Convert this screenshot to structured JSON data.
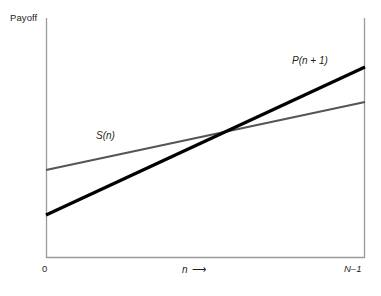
{
  "chart_data": {
    "type": "line",
    "title": "",
    "subtitle": "",
    "xlabel": "n",
    "xlabel_arrow": "⟶",
    "ylabel": "Payoff",
    "xticks": [
      "0",
      "N–1"
    ],
    "yticks": [],
    "grid": false,
    "legend": "inline-annotations",
    "xlim": [
      0,
      1
    ],
    "ylim": [
      0,
      1
    ],
    "axis_color": "#9a9a9a",
    "series": [
      {
        "name": "S(n)",
        "label": "S(n)",
        "color": "#555555",
        "width": 2.2,
        "x": [
          0,
          1
        ],
        "y": [
          0.367,
          0.65
        ],
        "px": [
          [
            46,
            170
          ],
          [
            365,
            102
          ]
        ],
        "label_pos": [
          96,
          131
        ]
      },
      {
        "name": "P(n + 1)",
        "label": "P(n + 1)",
        "color": "#000000",
        "width": 3.2,
        "x": [
          0,
          1
        ],
        "y": [
          0.179,
          0.796
        ],
        "px": [
          [
            46,
            215
          ],
          [
            365,
            67
          ]
        ],
        "label_pos": [
          292,
          56
        ]
      }
    ],
    "intersection": {
      "px": [
        218,
        132
      ]
    },
    "annotations": [
      {
        "text": "S(n)",
        "x": 96,
        "y": 131
      },
      {
        "text": "P(n + 1)",
        "x": 292,
        "y": 56
      }
    ]
  },
  "axes": {
    "y_axis_label": "Payoff",
    "x_axis_label": "n",
    "x_axis_arrow": "⟶",
    "tick_left": "0",
    "tick_right": "N–1"
  }
}
